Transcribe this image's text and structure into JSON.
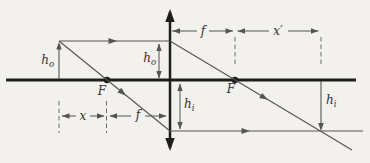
{
  "diagram": {
    "labels": {
      "object_height": {
        "base": "h",
        "sub": "o"
      },
      "object_height_at_lens": {
        "base": "h",
        "sub": "o"
      },
      "image_height_at_lens": {
        "base": "h",
        "sub": "i"
      },
      "image_height": {
        "base": "h",
        "sub": "i"
      },
      "left_focal_point": "F",
      "right_focal_point": "F",
      "focal_length_top": "f",
      "image_focal_distance": "x′",
      "object_focal_distance": "x",
      "focal_length_bottom": "f"
    },
    "colors": {
      "ink": "#1e1e1c",
      "ray": "#55544f",
      "background": "#f2f1ed"
    }
  }
}
